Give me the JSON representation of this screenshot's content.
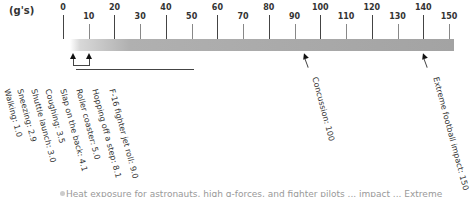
{
  "chart_data": {
    "type": "scale",
    "title": "",
    "unit_label": "(g's)",
    "axis": {
      "min": 0,
      "max": 150,
      "major_ticks": [
        0,
        20,
        40,
        60,
        80,
        100,
        120,
        140
      ],
      "minor_ticks": [
        10,
        30,
        50,
        70,
        90,
        110,
        130,
        150
      ]
    },
    "tick_labels": [
      "0",
      "10",
      "20",
      "30",
      "40",
      "50",
      "60",
      "70",
      "80",
      "90",
      "100",
      "110",
      "120",
      "130",
      "140",
      "150"
    ],
    "events": [
      {
        "label": "Walking: 1.0",
        "value": 1.0
      },
      {
        "label": "Sneezing: 2.9",
        "value": 2.9
      },
      {
        "label": "Shuttle launch: 3.0",
        "value": 3.0
      },
      {
        "label": "Coughing: 3.5",
        "value": 3.5
      },
      {
        "label": "Slap on the back: 4.1",
        "value": 4.1
      },
      {
        "label": "Roller coaster: 5.0",
        "value": 5.0
      },
      {
        "label": "Hopping off a step: 8.1",
        "value": 8.1
      },
      {
        "label": "F-16 fighter jet roll: 9.0",
        "value": 9.0
      },
      {
        "label": "Concussion: 100",
        "value": 100
      },
      {
        "label": "Extreme football impact: 150",
        "value": 150
      }
    ]
  },
  "caption": "Heat exposure for astronauts, high g-forces, and fighter pilots ... impact ... Extreme"
}
